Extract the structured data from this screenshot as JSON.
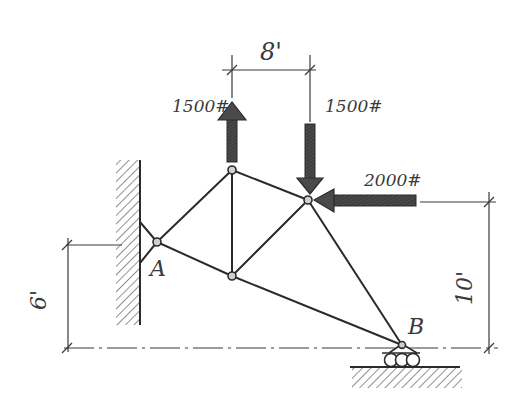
{
  "diagram": {
    "type": "truss",
    "style": "hand-drawn",
    "colors": {
      "ink": "#2b2b2b",
      "arrow_fill": "#4a4a4a",
      "background": "#ffffff"
    },
    "supports": {
      "A": {
        "label": "A",
        "type": "pin to wall"
      },
      "B": {
        "label": "B",
        "type": "roller on ground"
      }
    },
    "loads": [
      {
        "id": "load-up",
        "label": "1500#",
        "direction": "up",
        "node": "top-left"
      },
      {
        "id": "load-down",
        "label": "1500#",
        "direction": "down",
        "node": "right"
      },
      {
        "id": "load-left",
        "label": "2000#",
        "direction": "left",
        "node": "right"
      }
    ],
    "dimensions": {
      "horizontal_top": "8'",
      "left_vertical": "6'",
      "right_vertical": "10'"
    },
    "nodes": [
      "A",
      "top-left",
      "bottom-left",
      "right",
      "B"
    ],
    "members": [
      "A-top-left",
      "A-bottom-left",
      "top-left-bottom-left",
      "top-left-right",
      "bottom-left-right",
      "right-B",
      "bottom-left-B",
      "wall-A-upper",
      "wall-A-lower"
    ]
  }
}
